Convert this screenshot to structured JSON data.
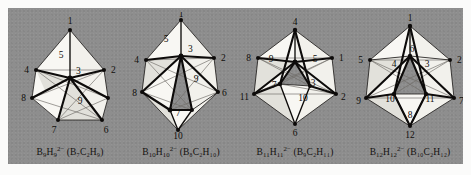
{
  "figure": {
    "background_color": "#8e8e8e",
    "face_color": "#f2f1ec",
    "edge_color": "#0d0b0a",
    "hidden_edge_color": "#6d6b66",
    "label_color": "#100e0c"
  },
  "clusters": [
    {
      "id": "b9h9",
      "name": "tricapped-trigonal-prism",
      "caption_parts": {
        "anion_element": "B",
        "anion_b_count": "9",
        "anion_h": "H",
        "anion_h_count": "9",
        "charge": "2−",
        "carborane": "(B₇C₂H₉)"
      },
      "caption_plain": "B9H9 2− (B7C2H9)",
      "vertices": [
        "1",
        "2",
        "3",
        "4",
        "5",
        "6",
        "7",
        "8",
        "9"
      ],
      "vertex_count": 9
    },
    {
      "id": "b10h10",
      "name": "bicapped-square-antiprism",
      "caption_parts": {
        "anion_element": "B",
        "anion_b_count": "10",
        "anion_h": "H",
        "anion_h_count": "10",
        "charge": "2−",
        "carborane": "(B₈C₂H₁₀)"
      },
      "caption_plain": "B10H10 2− (B8C2H10)",
      "vertices": [
        "1",
        "2",
        "3",
        "4",
        "5",
        "6",
        "7",
        "8",
        "9",
        "10"
      ],
      "vertex_count": 10
    },
    {
      "id": "b11h11",
      "name": "octadecahedron",
      "caption_parts": {
        "anion_element": "B",
        "anion_b_count": "11",
        "anion_h": "H",
        "anion_h_count": "11",
        "charge": "2−",
        "carborane": "(B₉C₂H₁₁)"
      },
      "caption_plain": "B11H11 2− (B9C2H11)",
      "vertices": [
        "1",
        "2",
        "3",
        "4",
        "5",
        "6",
        "7",
        "8",
        "9",
        "10",
        "11"
      ],
      "vertex_count": 11
    },
    {
      "id": "b12h12",
      "name": "icosahedron",
      "caption_parts": {
        "anion_element": "B",
        "anion_b_count": "12",
        "anion_h": "H",
        "anion_h_count": "12",
        "charge": "2−",
        "carborane": "(B₁₀C₂H₁₂)"
      },
      "caption_plain": "B12H12 2− (B10C2H12)",
      "vertices": [
        "1",
        "2",
        "3",
        "4",
        "5",
        "6",
        "7",
        "8",
        "9",
        "10",
        "11",
        "12"
      ],
      "vertex_count": 12
    }
  ],
  "labels": {
    "c1": {
      "v1": "1",
      "v2": "2",
      "v3": "3",
      "v4": "4",
      "v5": "5",
      "v6": "6",
      "v7": "7",
      "v8": "8",
      "v9": "9"
    },
    "c2": {
      "v1": "1",
      "v2": "2",
      "v3": "3",
      "v4": "4",
      "v5": "5",
      "v6": "6",
      "v7": "7",
      "v8": "8",
      "v9": "9",
      "v10": "10"
    },
    "c3": {
      "v1": "1",
      "v2": "2",
      "v3": "3",
      "v4": "4",
      "v5": "5",
      "v6": "6",
      "v7": "7",
      "v8": "8",
      "v9": "9",
      "v10": "10",
      "v11": "11"
    },
    "c4": {
      "v1": "1",
      "v2": "2",
      "v3": "3",
      "v4": "4",
      "v5": "5",
      "v6": "6",
      "v7": "7",
      "v8": "8",
      "v9": "9",
      "v10": "10",
      "v11": "11",
      "v12": "12"
    }
  }
}
